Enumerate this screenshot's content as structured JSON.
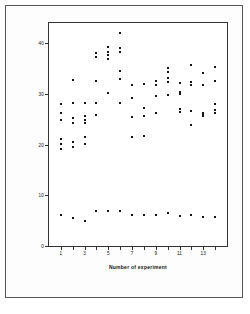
{
  "chart_data": {
    "type": "scatter",
    "title": "",
    "xlabel": "Number of experiment",
    "ylabel": "Na,K−ATPase (μmol/min · mg protein)",
    "xlim": [
      0,
      15
    ],
    "ylim": [
      0,
      44
    ],
    "grid": false,
    "legend": null,
    "marker": "square",
    "marker_color": "#151515",
    "xticks": [
      1,
      2,
      3,
      4,
      5,
      6,
      7,
      8,
      9,
      10,
      11,
      12,
      13,
      14
    ],
    "xtick_labels": [
      "1",
      "",
      "3",
      "",
      "5",
      "",
      "7",
      "",
      "9",
      "",
      "11",
      "",
      "13",
      ""
    ],
    "yticks": [
      0,
      10,
      20,
      30,
      40
    ],
    "ytick_labels": [
      "0",
      "10",
      "20",
      "30",
      "40"
    ],
    "series": [
      {
        "name": "upper-values",
        "points": [
          [
            1,
            28.0
          ],
          [
            1,
            26.3
          ],
          [
            1,
            24.8
          ],
          [
            1,
            21.2
          ],
          [
            1,
            20.2
          ],
          [
            1,
            19.2
          ],
          [
            2,
            32.8
          ],
          [
            2,
            28.3
          ],
          [
            2,
            25.2
          ],
          [
            2,
            24.3
          ],
          [
            2,
            20.5
          ],
          [
            2,
            19.5
          ],
          [
            3,
            28.2
          ],
          [
            3,
            25.6
          ],
          [
            3,
            24.8
          ],
          [
            3,
            24.3
          ],
          [
            3,
            21.5
          ],
          [
            3,
            20.2
          ],
          [
            4,
            38.0
          ],
          [
            4,
            37.2
          ],
          [
            4,
            32.6
          ],
          [
            4,
            28.2
          ],
          [
            4,
            25.8
          ],
          [
            5,
            39.2
          ],
          [
            5,
            38.3
          ],
          [
            5,
            37.6
          ],
          [
            5,
            36.8
          ],
          [
            5,
            30.2
          ],
          [
            6,
            42.0
          ],
          [
            6,
            39.0
          ],
          [
            6,
            38.3
          ],
          [
            6,
            34.5
          ],
          [
            6,
            33.0
          ],
          [
            6,
            28.3
          ],
          [
            7,
            31.8
          ],
          [
            7,
            29.2
          ],
          [
            7,
            25.5
          ],
          [
            7,
            21.5
          ],
          [
            8,
            32.0
          ],
          [
            8,
            27.2
          ],
          [
            8,
            25.6
          ],
          [
            8,
            21.8
          ],
          [
            9,
            32.5
          ],
          [
            9,
            31.8
          ],
          [
            9,
            29.6
          ],
          [
            9,
            26.3
          ],
          [
            10,
            35.2
          ],
          [
            10,
            34.4
          ],
          [
            10,
            33.2
          ],
          [
            10,
            32.3
          ],
          [
            10,
            29.8
          ],
          [
            11,
            32.2
          ],
          [
            11,
            30.4
          ],
          [
            11,
            30.0
          ],
          [
            11,
            27.0
          ],
          [
            11,
            26.5
          ],
          [
            12,
            35.8
          ],
          [
            12,
            32.4
          ],
          [
            12,
            31.8
          ],
          [
            12,
            26.6
          ],
          [
            12,
            23.8
          ],
          [
            13,
            34.2
          ],
          [
            13,
            31.8
          ],
          [
            13,
            26.3
          ],
          [
            13,
            26.0
          ],
          [
            13,
            25.6
          ],
          [
            14,
            35.3
          ],
          [
            14,
            32.6
          ],
          [
            14,
            28.0
          ],
          [
            14,
            26.8
          ],
          [
            14,
            26.2
          ]
        ]
      },
      {
        "name": "lower-values",
        "points": [
          [
            1,
            6.2
          ],
          [
            2,
            5.6
          ],
          [
            3,
            5.0
          ],
          [
            4,
            7.0
          ],
          [
            5,
            6.9
          ],
          [
            6,
            7.0
          ],
          [
            7,
            6.1
          ],
          [
            8,
            6.1
          ],
          [
            9,
            6.1
          ],
          [
            10,
            6.6
          ],
          [
            11,
            6.0
          ],
          [
            12,
            6.1
          ],
          [
            13,
            5.7
          ],
          [
            14,
            5.7
          ]
        ]
      }
    ]
  }
}
